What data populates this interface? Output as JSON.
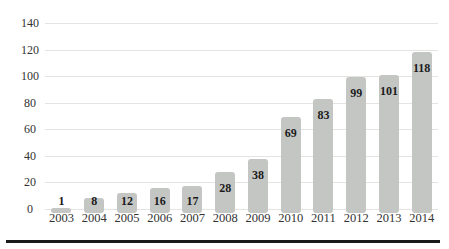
{
  "chart_data": {
    "type": "bar",
    "title": "",
    "xlabel": "",
    "ylabel": "",
    "categories": [
      "2003",
      "2004",
      "2005",
      "2006",
      "2007",
      "2008",
      "2009",
      "2010",
      "2011",
      "2012",
      "2013",
      "2014"
    ],
    "values": [
      1,
      8,
      12,
      16,
      17,
      28,
      38,
      69,
      83,
      99,
      101,
      118
    ],
    "yticks": [
      0,
      20,
      40,
      60,
      80,
      100,
      120,
      140
    ],
    "ylim": [
      0,
      140
    ],
    "grid": true,
    "legend": "none",
    "value_labels_position": "inside-end",
    "colors": {
      "bar_fill": "#c4c6c4",
      "value_label_text": "#1c1c1c",
      "axis_tick_text": "#333333",
      "gridline": "#e4e4e2",
      "bottom_rule": "#1b1b1b",
      "background": "#ffffff"
    }
  }
}
